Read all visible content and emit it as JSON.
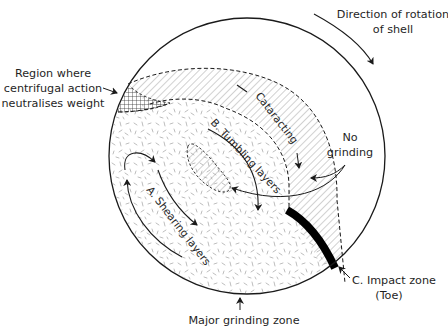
{
  "diagram": {
    "colors": {
      "line": "#1a1a1a",
      "hatch": "#9a9a9a",
      "speckle": "#b8b8b8",
      "impact": "#000000",
      "background": "#ffffff"
    },
    "labels": {
      "rotation_line1": "Direction of rotation",
      "rotation_line2": "of shell",
      "region_line1": "Region where",
      "region_line2": "centrifugal action",
      "region_line3": "neutralises weight",
      "no_grinding_line1": "No",
      "no_grinding_line2": "grinding",
      "cataracting": "Cataracting",
      "tumbling": "B. Tumbling layers",
      "shearing": "A. Shearing layers",
      "impact_line1": "C. Impact zone",
      "impact_line2": "(Toe)",
      "major_grinding": "Major grinding zone"
    },
    "zones": [
      {
        "id": "A",
        "name": "Shearing layers",
        "pattern": "speckle"
      },
      {
        "id": "B",
        "name": "Tumbling layers",
        "pattern": "speckle"
      },
      {
        "id": "C",
        "name": "Impact zone (Toe)",
        "pattern": "solid-black"
      },
      {
        "id": "cataracting",
        "name": "Cataracting",
        "pattern": "diagonal-hatch"
      },
      {
        "id": "centrifugal",
        "name": "Region where centrifugal action neutralises weight",
        "pattern": "cross-hatch"
      }
    ],
    "shell": {
      "cx": 247,
      "cy": 156,
      "r": 138
    }
  }
}
